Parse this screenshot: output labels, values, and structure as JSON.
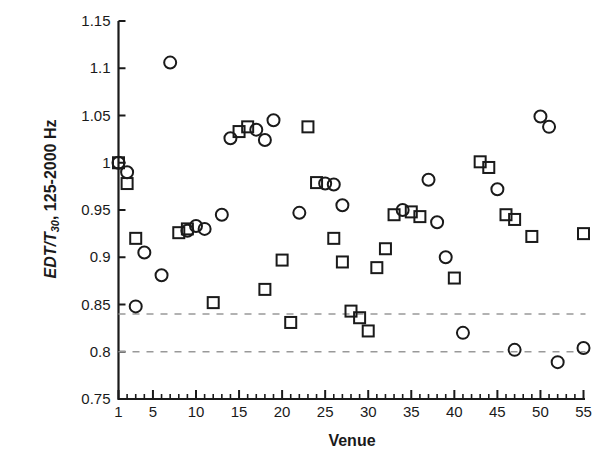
{
  "chart_data": {
    "type": "scatter",
    "title": "",
    "xlabel": "Venue",
    "ylabel": "EDT/T30, 125-2000 Hz",
    "ylabel_parts": {
      "italic": "EDT/T",
      "sub": "30",
      "rest": ", 125-2000 Hz"
    },
    "xlim": [
      1,
      55
    ],
    "ylim": [
      0.75,
      1.15
    ],
    "xticks": [
      1,
      5,
      10,
      15,
      20,
      25,
      30,
      35,
      40,
      45,
      50,
      55
    ],
    "xtick_labels": [
      "1",
      "5",
      "10",
      "15",
      "20",
      "25",
      "30",
      "35",
      "40",
      "45",
      "50",
      "55"
    ],
    "yticks": [
      0.75,
      0.8,
      0.85,
      0.9,
      0.95,
      1,
      1.05,
      1.1,
      1.15
    ],
    "ytick_labels": [
      "0.75",
      "0.8",
      "0.85",
      "0.9",
      "0.95",
      "1",
      "1.05",
      "1.1",
      "1.15"
    ],
    "minor_xtick_interval": 1,
    "grid": false,
    "legend": null,
    "reference_lines": [
      {
        "name": "upper-jnd-line",
        "y": 0.84,
        "style": "dashed",
        "color": "#999999"
      },
      {
        "name": "lower-jnd-line",
        "y": 0.8,
        "style": "dashed",
        "color": "#999999"
      }
    ],
    "marker_color": "#1a1a1a",
    "marker_fill": "none",
    "series": [
      {
        "name": "circle-series",
        "marker": "circle",
        "points": [
          {
            "x": 1,
            "y": 1.0
          },
          {
            "x": 2,
            "y": 0.99
          },
          {
            "x": 3,
            "y": 0.848
          },
          {
            "x": 4,
            "y": 0.905
          },
          {
            "x": 6,
            "y": 0.881
          },
          {
            "x": 7,
            "y": 1.106
          },
          {
            "x": 9,
            "y": 0.928
          },
          {
            "x": 10,
            "y": 0.933
          },
          {
            "x": 11,
            "y": 0.93
          },
          {
            "x": 13,
            "y": 0.945
          },
          {
            "x": 14,
            "y": 1.026
          },
          {
            "x": 17,
            "y": 1.035
          },
          {
            "x": 18,
            "y": 1.024
          },
          {
            "x": 19,
            "y": 1.045
          },
          {
            "x": 22,
            "y": 0.947
          },
          {
            "x": 25,
            "y": 0.978
          },
          {
            "x": 26,
            "y": 0.977
          },
          {
            "x": 27,
            "y": 0.955
          },
          {
            "x": 34,
            "y": 0.95
          },
          {
            "x": 37,
            "y": 0.982
          },
          {
            "x": 38,
            "y": 0.937
          },
          {
            "x": 39,
            "y": 0.9
          },
          {
            "x": 41,
            "y": 0.82
          },
          {
            "x": 45,
            "y": 0.972
          },
          {
            "x": 47,
            "y": 0.802
          },
          {
            "x": 50,
            "y": 1.049
          },
          {
            "x": 51,
            "y": 1.038
          },
          {
            "x": 52,
            "y": 0.789
          },
          {
            "x": 55,
            "y": 0.804
          }
        ]
      },
      {
        "name": "square-series",
        "marker": "square",
        "points": [
          {
            "x": 1,
            "y": 1.0
          },
          {
            "x": 2,
            "y": 0.978
          },
          {
            "x": 3,
            "y": 0.92
          },
          {
            "x": 8,
            "y": 0.926
          },
          {
            "x": 9,
            "y": 0.93
          },
          {
            "x": 12,
            "y": 0.852
          },
          {
            "x": 15,
            "y": 1.033
          },
          {
            "x": 16,
            "y": 1.038
          },
          {
            "x": 18,
            "y": 0.866
          },
          {
            "x": 20,
            "y": 0.897
          },
          {
            "x": 21,
            "y": 0.831
          },
          {
            "x": 23,
            "y": 1.038
          },
          {
            "x": 24,
            "y": 0.979
          },
          {
            "x": 26,
            "y": 0.92
          },
          {
            "x": 27,
            "y": 0.895
          },
          {
            "x": 28,
            "y": 0.843
          },
          {
            "x": 29,
            "y": 0.836
          },
          {
            "x": 30,
            "y": 0.822
          },
          {
            "x": 31,
            "y": 0.889
          },
          {
            "x": 32,
            "y": 0.909
          },
          {
            "x": 33,
            "y": 0.945
          },
          {
            "x": 35,
            "y": 0.948
          },
          {
            "x": 36,
            "y": 0.943
          },
          {
            "x": 40,
            "y": 0.878
          },
          {
            "x": 43,
            "y": 1.001
          },
          {
            "x": 44,
            "y": 0.995
          },
          {
            "x": 46,
            "y": 0.945
          },
          {
            "x": 47,
            "y": 0.94
          },
          {
            "x": 49,
            "y": 0.922
          },
          {
            "x": 55,
            "y": 0.925
          }
        ]
      }
    ]
  }
}
